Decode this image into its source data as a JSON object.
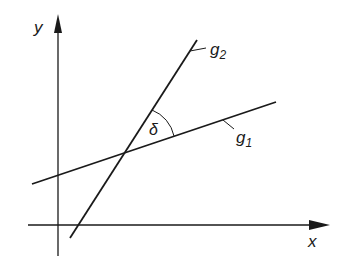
{
  "diagram": {
    "type": "angle-between-lines",
    "axes": {
      "x_label": "x",
      "y_label": "y"
    },
    "lines": [
      {
        "name": "g1",
        "label_main": "g",
        "label_sub": "1"
      },
      {
        "name": "g2",
        "label_main": "g",
        "label_sub": "2"
      }
    ],
    "angle_label": "δ",
    "colors": {
      "stroke": "#1a1a1a",
      "background": "#ffffff"
    }
  }
}
